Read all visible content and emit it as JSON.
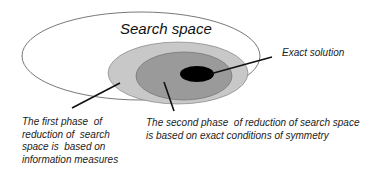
{
  "diagram": {
    "title": "Search space",
    "regions": [
      {
        "name": "search-space",
        "fill": "#ffffff",
        "stroke": "#555555"
      },
      {
        "name": "first-phase-region",
        "fill": "#c8c8c8",
        "stroke": "#777777"
      },
      {
        "name": "second-phase-region",
        "fill": "#9a9a9a",
        "stroke": "#666666"
      },
      {
        "name": "exact-solution-region",
        "fill": "#000000",
        "stroke": "#000000"
      }
    ],
    "labels": {
      "exact_solution": "Exact solution",
      "first_phase": "The first phase  of\nreduction of  search\nspace is  based on\ninformation measures",
      "second_phase": "The second phase  of reduction of search space\nis based on exact conditions of symmetry"
    }
  }
}
